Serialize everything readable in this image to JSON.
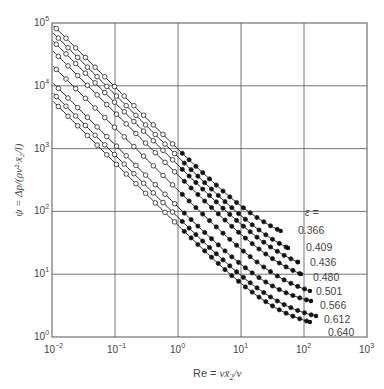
{
  "chart_data": {
    "type": "scatter",
    "title": "",
    "xlabel": "Re = v x̄2 / ν",
    "ylabel": "ψ = Δp / (ρv² · x̄2 / l)",
    "xscale": "log",
    "yscale": "log",
    "xlim": [
      0.01,
      1000
    ],
    "ylim": [
      1,
      100000
    ],
    "grid": true,
    "x_ticks": [
      "10^-2",
      "10^-1",
      "10^0",
      "10^1",
      "10^2",
      "10^3"
    ],
    "y_ticks": [
      "10^0",
      "10^1",
      "10^2",
      "10^3",
      "10^4",
      "10^5"
    ],
    "legend_title": "ε =",
    "legend_position": "right, inline at curve ends",
    "marker_note": "open circles for Re < ~1, filled circles for Re > ~1; curves follow ψ = A/Re + B",
    "series": [
      {
        "name": "0.366",
        "A": 955,
        "B": 26.6,
        "re_start": 0.0105,
        "re_end": 42.7,
        "label_pos": [
          298,
          234
        ]
      },
      {
        "name": "0.409",
        "A": 724,
        "B": 13.1,
        "re_start": 0.0105,
        "re_end": 55.7,
        "label_pos": [
          306,
          251
        ]
      },
      {
        "name": "0.436",
        "A": 537,
        "B": 8.9,
        "re_start": 0.0105,
        "re_end": 80.4,
        "label_pos": [
          310,
          266
        ]
      },
      {
        "name": "0.480",
        "A": 372,
        "B": 5.9,
        "re_start": 0.0105,
        "re_end": 89.6,
        "label_pos": [
          313,
          281
        ]
      },
      {
        "name": "0.501",
        "A": 214,
        "B": 3.7,
        "re_start": 0.0105,
        "re_end": 124,
        "label_pos": [
          316,
          295
        ]
      },
      {
        "name": "0.566",
        "A": 115,
        "B": 2.85,
        "re_start": 0.0105,
        "re_end": 129,
        "label_pos": [
          320,
          309
        ]
      },
      {
        "name": "0.612",
        "A": 79,
        "B": 1.65,
        "re_start": 0.0105,
        "re_end": 155,
        "label_pos": [
          324,
          323
        ]
      },
      {
        "name": "0.640",
        "A": 59,
        "B": 1.26,
        "re_start": 0.0105,
        "re_end": 124,
        "label_pos": [
          328,
          336
        ]
      }
    ],
    "sample_points": {
      "0.366": [
        [
          0.01,
          95500
        ],
        [
          0.1,
          9576
        ],
        [
          1,
          982
        ],
        [
          10,
          122
        ],
        [
          42.7,
          49
        ]
      ],
      "0.409": [
        [
          0.01,
          72413
        ],
        [
          0.1,
          7253
        ],
        [
          1,
          737
        ],
        [
          10,
          85.5
        ],
        [
          55.7,
          26.1
        ]
      ],
      "0.436": [
        [
          0.01,
          53709
        ],
        [
          0.1,
          5379
        ],
        [
          1,
          546
        ],
        [
          10,
          62.6
        ],
        [
          80.4,
          15.6
        ]
      ],
      "0.480": [
        [
          0.01,
          37206
        ],
        [
          0.1,
          3726
        ],
        [
          1,
          378
        ],
        [
          10,
          43.1
        ],
        [
          89.6,
          10.1
        ]
      ],
      "0.501": [
        [
          0.01,
          21404
        ],
        [
          0.1,
          2144
        ],
        [
          1,
          218
        ],
        [
          10,
          25.1
        ],
        [
          124,
          5.4
        ]
      ],
      "0.566": [
        [
          0.01,
          11503
        ],
        [
          0.1,
          1153
        ],
        [
          1,
          118
        ],
        [
          10,
          14.4
        ],
        [
          129,
          3.74
        ]
      ],
      "0.612": [
        [
          0.01,
          7902
        ],
        [
          0.1,
          792
        ],
        [
          1,
          80.7
        ],
        [
          10,
          9.55
        ],
        [
          155,
          2.16
        ]
      ],
      "0.640": [
        [
          0.01,
          5901
        ],
        [
          0.1,
          591
        ],
        [
          1,
          60.3
        ],
        [
          10,
          7.16
        ],
        [
          124,
          1.74
        ]
      ]
    }
  },
  "axes": {
    "x_label_prefix": "Re = ",
    "x_label_expr": "vx̄",
    "x_label_sub": "2",
    "x_label_suffix": "/ν",
    "y_label": "ψ = Δp/(ρv²·x̄₂/l)",
    "x_tick_base": "10",
    "x_tick_exps": [
      "−2",
      "−1",
      "0",
      "1",
      "2",
      "3"
    ],
    "y_tick_exps": [
      "0",
      "1",
      "2",
      "3",
      "4",
      "5"
    ],
    "legend_title": "ε ="
  }
}
